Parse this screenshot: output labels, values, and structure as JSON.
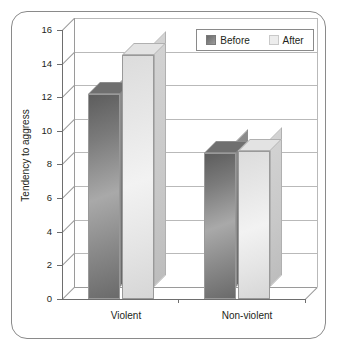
{
  "chart_data": {
    "type": "bar",
    "title": "",
    "subtitle": "",
    "xlabel": "",
    "ylabel": "Tendency to aggress",
    "categories": [
      "Violent",
      "Non-violent"
    ],
    "series": [
      {
        "name": "Before",
        "values": [
          12.2,
          8.7
        ],
        "color": "#7b7b7b"
      },
      {
        "name": "After",
        "values": [
          14.5,
          8.8
        ],
        "color": "#ededed"
      }
    ],
    "ylim": [
      0,
      16
    ],
    "ytick_step": 2,
    "yticks": [
      0,
      2,
      4,
      6,
      8,
      10,
      12,
      14,
      16
    ],
    "ytick_labels": [
      "0",
      "2",
      "4",
      "6",
      "8",
      "10",
      "12",
      "14",
      "16"
    ],
    "grid": true,
    "grid_axis": "y",
    "legend_position": "top-right",
    "style": "3d-column",
    "frame": "rounded-border"
  },
  "legend": {
    "entries": [
      {
        "label": "Before",
        "swatch": "before-swatch"
      },
      {
        "label": "After",
        "swatch": "after-swatch"
      }
    ]
  },
  "axes": {
    "y_label": "Tendency to aggress",
    "y_ticks": [
      "16",
      "14",
      "12",
      "10",
      "8",
      "6",
      "4",
      "2",
      "0"
    ],
    "x_categories": [
      "Violent",
      "Non-violent"
    ]
  },
  "colors": {
    "frame_border": "#8a8a8a",
    "axis": "#6e6e6e",
    "gridline": "#b9b9b9",
    "text": "#231f20",
    "series_before": "#7b7b7b",
    "series_after": "#ededed",
    "background": "#ffffff"
  }
}
